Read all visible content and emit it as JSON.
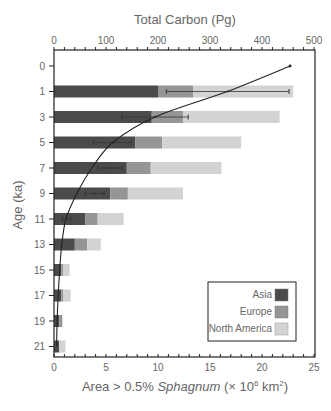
{
  "chart_data": {
    "type": "bar",
    "orientation": "horizontal",
    "stacked": true,
    "title": "",
    "top_axis_label": "Total Carbon (Pg)",
    "top_axis_ticks": [
      0,
      100,
      200,
      300,
      400,
      500
    ],
    "top_axis_range": [
      0,
      500
    ],
    "xlabel_prefix": "Area > 0.5% ",
    "xlabel_italic": "Sphagnum",
    "xlabel_suffix": " (× 10",
    "xlabel_sup1": "6",
    "xlabel_mid": " km",
    "xlabel_sup2": "2",
    "xlabel_end": ")",
    "xlabel": "Area > 0.5% Sphagnum (× 10^6 km^2)",
    "xlim": [
      0,
      25
    ],
    "x_ticks": [
      0,
      5,
      10,
      15,
      20,
      25
    ],
    "ylabel": "Age (ka)",
    "categories": [
      "0",
      "1",
      "3",
      "5",
      "7",
      "9",
      "11",
      "13",
      "15",
      "17",
      "19",
      "21"
    ],
    "series": [
      {
        "name": "Asia",
        "color": "#4b4b4b",
        "values": [
          0,
          10.0,
          9.4,
          7.8,
          7.0,
          5.4,
          3.0,
          2.0,
          0.7,
          0.7,
          0.5,
          0.5
        ]
      },
      {
        "name": "Europe",
        "color": "#959595",
        "values": [
          0,
          3.4,
          3.0,
          2.6,
          2.3,
          1.7,
          1.2,
          1.2,
          0.2,
          0.2,
          0.3,
          0.0
        ]
      },
      {
        "name": "North America",
        "color": "#d3d3d3",
        "values": [
          0,
          9.6,
          9.3,
          7.6,
          6.8,
          5.3,
          2.5,
          1.3,
          0.6,
          0.7,
          0.0,
          0.6
        ]
      }
    ],
    "error_bars": [
      {
        "age": "1",
        "from": 10.8,
        "to": 22.6
      },
      {
        "age": "3",
        "from": 6.5,
        "to": 12.9
      },
      {
        "age": "5",
        "from": 3.8,
        "to": 7.4
      },
      {
        "age": "7",
        "from": 4.2,
        "to": 6.6
      },
      {
        "age": "9",
        "from": 3.0,
        "to": 4.8
      },
      {
        "age": "11",
        "from": 0.8,
        "to": 1.6
      }
    ],
    "carbon_curve": {
      "name": "Total Carbon",
      "axis": "top",
      "ages": [
        "0",
        "1",
        "3",
        "5",
        "7",
        "9",
        "11",
        "13",
        "15",
        "17",
        "19",
        "21"
      ],
      "values": [
        454,
        333,
        194,
        113,
        73,
        44,
        23,
        15,
        11,
        8,
        6,
        5
      ]
    },
    "legend": {
      "position": "lower right",
      "entries": [
        {
          "label": "Asia",
          "color": "#4b4b4b"
        },
        {
          "label": "Europe",
          "color": "#959595"
        },
        {
          "label": "North America",
          "color": "#d3d3d3"
        }
      ]
    },
    "grid": false
  }
}
